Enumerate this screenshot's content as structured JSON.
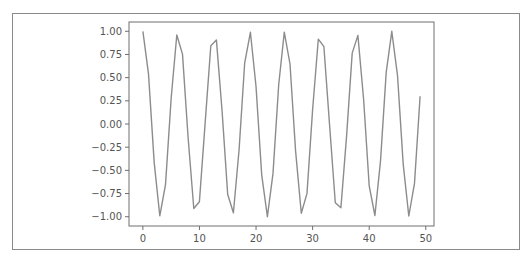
{
  "chart_data": {
    "type": "line",
    "title": "",
    "xlabel": "",
    "ylabel": "",
    "xlim": [
      -2.45,
      51.45
    ],
    "ylim": [
      -1.1,
      1.1
    ],
    "grid": false,
    "legend": null,
    "x_ticks": [
      0,
      10,
      20,
      30,
      40,
      50
    ],
    "x_tick_labels": [
      "0",
      "10",
      "20",
      "30",
      "40",
      "50"
    ],
    "y_ticks": [
      1.0,
      0.75,
      0.5,
      0.25,
      0.0,
      -0.25,
      -0.5,
      -0.75,
      -1.0
    ],
    "y_tick_labels": [
      "1.00",
      "0.75",
      "0.50",
      "0.25",
      "0.00",
      "−0.25",
      "−0.50",
      "−0.75",
      "−1.00"
    ],
    "series": [
      {
        "name": "cos(x)",
        "color": "#8c8c8c",
        "x": [
          0,
          1,
          2,
          3,
          4,
          5,
          6,
          7,
          8,
          9,
          10,
          11,
          12,
          13,
          14,
          15,
          16,
          17,
          18,
          19,
          20,
          21,
          22,
          23,
          24,
          25,
          26,
          27,
          28,
          29,
          30,
          31,
          32,
          33,
          34,
          35,
          36,
          37,
          38,
          39,
          40,
          41,
          42,
          43,
          44,
          45,
          46,
          47,
          48,
          49
        ],
        "values": [
          1.0,
          0.54,
          -0.416,
          -0.99,
          -0.654,
          0.284,
          0.96,
          0.754,
          -0.146,
          -0.911,
          -0.839,
          0.004,
          0.844,
          0.907,
          0.137,
          -0.76,
          -0.958,
          -0.275,
          0.66,
          0.989,
          0.408,
          -0.548,
          -1.0,
          -0.533,
          0.424,
          0.991,
          0.647,
          -0.292,
          -0.963,
          -0.748,
          0.154,
          0.915,
          0.834,
          -0.013,
          -0.849,
          -0.904,
          -0.128,
          0.765,
          0.955,
          0.267,
          -0.667,
          -0.987,
          -0.4,
          0.556,
          1.0,
          0.525,
          -0.432,
          -0.992,
          -0.641,
          0.3
        ]
      }
    ]
  },
  "colors": {
    "axes": "#6e6e6e",
    "frame": "#8a8a8a",
    "text": "#555555"
  }
}
